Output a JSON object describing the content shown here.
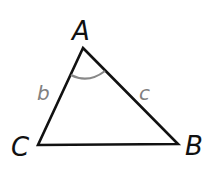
{
  "diagram": {
    "type": "triangle",
    "vertices": {
      "A": {
        "label": "A",
        "x": 83,
        "y": 48
      },
      "B": {
        "label": "B",
        "x": 178,
        "y": 144
      },
      "C": {
        "label": "C",
        "x": 38,
        "y": 145
      }
    },
    "sides": {
      "b": {
        "label": "b",
        "color": "#808080"
      },
      "c": {
        "label": "c",
        "color": "#808080"
      }
    },
    "angle_marker": {
      "vertex": "A",
      "color": "#808080"
    },
    "colors": {
      "stroke": "#111111",
      "side_label": "#808080",
      "vertex_label": "#111111"
    }
  }
}
